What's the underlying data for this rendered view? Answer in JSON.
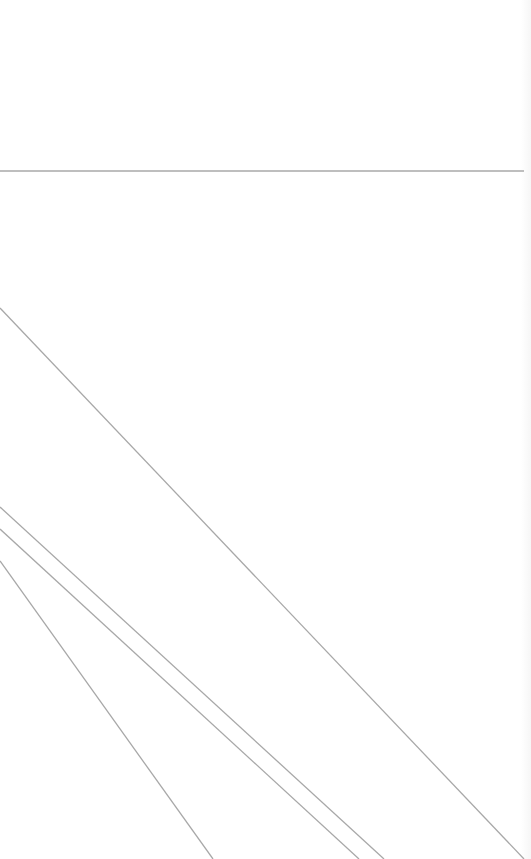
{
  "canvas": {
    "background": "#ffffff",
    "line_color": "#a8a8a8",
    "horizontal_line": {
      "x1": 0,
      "y1": 171,
      "x2": 524,
      "y2": 171
    },
    "diagonal_lines": [
      {
        "x1": 0,
        "y1": 308,
        "x2": 524,
        "y2": 859
      },
      {
        "x1": 0,
        "y1": 507,
        "x2": 384,
        "y2": 859
      },
      {
        "x1": 0,
        "y1": 529,
        "x2": 359,
        "y2": 859
      },
      {
        "x1": 0,
        "y1": 561,
        "x2": 213,
        "y2": 859
      }
    ]
  }
}
